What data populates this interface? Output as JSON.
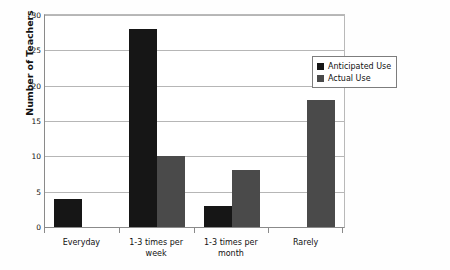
{
  "chart_data": {
    "type": "bar",
    "title": "",
    "xlabel": "",
    "ylabel": "Number of Teachers",
    "ylim": [
      0,
      30
    ],
    "ytick_step": 5,
    "yticks": [
      0,
      5,
      10,
      15,
      20,
      25,
      30
    ],
    "grid": true,
    "legend_position": "top-right-inside",
    "categories": [
      "Everyday",
      "1-3 times per week",
      "1-3 times per month",
      "Rarely"
    ],
    "series": [
      {
        "name": "Anticipated Use",
        "color": "#161616",
        "values": [
          4,
          28,
          3,
          0
        ]
      },
      {
        "name": "Actual Use",
        "color": "#4a4a4a",
        "values": [
          0,
          10,
          8,
          18
        ]
      }
    ]
  },
  "legend": {
    "items": [
      {
        "label": "Anticipated Use",
        "swatch": "legend-swatch-anticipated"
      },
      {
        "label": "Actual Use",
        "swatch": "legend-swatch-actual"
      }
    ]
  },
  "axes": {
    "y_title": "Number of Teachers",
    "y_tick_labels": [
      "0",
      "5",
      "10",
      "15",
      "20",
      "25",
      "30"
    ],
    "x_tick_labels": [
      "Everyday",
      "1-3 times per week",
      "1-3 times per month",
      "Rarely"
    ]
  },
  "colors": {
    "anticipated": "#161616",
    "actual": "#4a4a4a",
    "gridline": "#b6b6b6",
    "axis": "#8a8a8a",
    "text": "#111111",
    "plot_background": "#ffffff",
    "page_background": "#fdfdfc"
  }
}
